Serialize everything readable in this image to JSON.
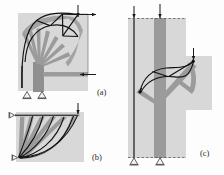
{
  "figure": {
    "background_color": "#fdfdfd",
    "domain_fill": "#d9d9d9",
    "strut_color": "#9a9a9a",
    "strut_color_dark": "#8a8a8a",
    "tie_color": "#111111",
    "support_color": "#f2f2f2",
    "support_stroke": "#3a3a3a",
    "arrow_color": "#1a1a1a",
    "panels": [
      {
        "id": "a",
        "label": "(a)",
        "label_x": 97,
        "label_y": 95,
        "description": "Quarter-circle knee joint: vertical column with fan of compression struts spreading into a curved arch, two pin supports at base, horizontal load arrow at mid-right and inclined load arrow at top right corner.",
        "domain": {
          "x": 18,
          "y": 13,
          "width": 70,
          "height": 78
        },
        "loads": [
          {
            "name": "top-right-vertical-load",
            "x": 78,
            "y": 12,
            "direction": "down",
            "length": 14
          },
          {
            "name": "top-right-horizontal-load",
            "x": 94,
            "y": 19,
            "direction": "right",
            "length": 14
          },
          {
            "name": "mid-right-horizontal-load",
            "x": 94,
            "y": 77,
            "direction": "left",
            "length": 16
          }
        ],
        "supports": [
          {
            "name": "pin-support-left",
            "x": 27,
            "y": 92
          },
          {
            "name": "pin-support-right",
            "x": 42,
            "y": 92
          }
        ]
      },
      {
        "id": "b",
        "label": "(b)",
        "label_x": 92,
        "label_y": 160,
        "description": "Corbel / deep beam quadrant: top chord tie along upper edge, radiating compression struts from lower-left support to curved bottom profile, vertical point load at top right.",
        "domain": {
          "x": 16,
          "y": 112,
          "width": 68,
          "height": 50
        },
        "loads": [
          {
            "name": "top-right-vertical-load",
            "x": 78,
            "y": 104,
            "direction": "down",
            "length": 12
          }
        ],
        "supports": [
          {
            "name": "roller-support-top-left",
            "x": 15,
            "y": 116
          },
          {
            "name": "roller-support-bottom-left",
            "x": 15,
            "y": 158
          }
        ]
      },
      {
        "id": "c",
        "label": "(c)",
        "label_x": 200,
        "label_y": 156,
        "description": "Column with bracket/haunch: vertical column domain with heavy compression core, branching strut fan to cantilever bracket at right, black tension ties from column face to bracket tip, two pin supports at base, two vertical loads at top and one at bracket tip.",
        "domain_column": {
          "x": 128,
          "y": 18,
          "width": 58,
          "height": 140
        },
        "domain_bracket": {
          "x": 186,
          "y": 56,
          "width": 26,
          "height": 54
        },
        "loads": [
          {
            "name": "column-left-vertical-load",
            "x": 133,
            "y": 10,
            "direction": "down",
            "length": 12
          },
          {
            "name": "column-right-vertical-load",
            "x": 159,
            "y": 8,
            "direction": "down",
            "length": 14
          },
          {
            "name": "bracket-tip-vertical-load",
            "x": 194,
            "y": 48,
            "direction": "down",
            "length": 12
          }
        ],
        "supports": [
          {
            "name": "pin-support-left",
            "x": 134,
            "y": 159
          },
          {
            "name": "pin-support-right",
            "x": 161,
            "y": 159
          }
        ]
      }
    ]
  }
}
